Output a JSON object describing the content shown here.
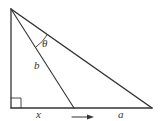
{
  "diagram": {
    "type": "right-triangle-geometry",
    "colors": {
      "stroke": "#333333",
      "background": "#ffffff"
    },
    "vertices": {
      "top": [
        11,
        9
      ],
      "right_angle": [
        11,
        108
      ],
      "right": [
        152,
        108
      ],
      "base_point": [
        74,
        108
      ]
    },
    "labels": {
      "theta": "θ",
      "b": "b",
      "x": "x",
      "a": "a"
    },
    "arrow": {
      "direction": "right"
    }
  }
}
